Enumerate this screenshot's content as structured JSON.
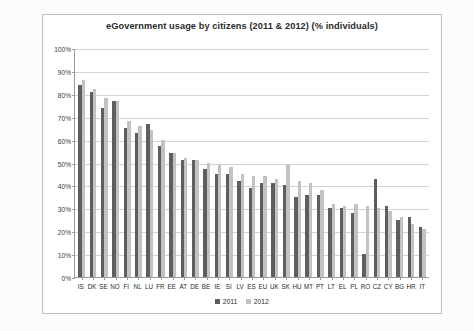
{
  "chart_data": {
    "type": "bar",
    "title": "eGovernment usage by citizens (2011 & 2012) (% individuals)",
    "xlabel": "",
    "ylabel": "",
    "ylim": [
      0,
      100
    ],
    "ytick_labels": [
      "100%",
      "90%",
      "80%",
      "70%",
      "60%",
      "50%",
      "40%",
      "30%",
      "20%",
      "10%",
      "0%"
    ],
    "ytick_values": [
      100,
      90,
      80,
      70,
      60,
      50,
      40,
      30,
      20,
      10,
      0
    ],
    "grid": true,
    "legend_position": "bottom",
    "categories": [
      "IS",
      "DK",
      "SE",
      "NO",
      "FI",
      "NL",
      "LU",
      "FR",
      "EE",
      "AT",
      "DE",
      "BE",
      "IE",
      "SI",
      "LV",
      "ES",
      "EU",
      "UK",
      "SK",
      "HU",
      "MT",
      "PT",
      "LT",
      "EL",
      "PL",
      "RO",
      "CZ",
      "CY",
      "BG",
      "HR",
      "IT"
    ],
    "series": [
      {
        "name": "2011",
        "color": "#5e5e5e",
        "values": [
          84,
          81,
          74,
          77,
          65,
          63,
          67,
          57,
          54,
          51,
          51,
          47,
          45,
          45,
          42,
          39,
          41,
          41,
          40,
          35,
          36,
          36,
          30,
          30,
          28,
          10,
          43,
          31,
          25,
          26,
          22
        ]
      },
      {
        "name": "2012",
        "color": "#c2c2c2",
        "values": [
          86,
          82,
          78,
          77,
          68,
          66,
          64,
          60,
          54,
          52,
          51,
          50,
          49,
          48,
          45,
          44,
          44,
          43,
          49,
          42,
          41,
          38,
          32,
          31,
          32,
          31,
          30,
          29,
          26,
          23,
          21
        ]
      }
    ],
    "legend": [
      "2011",
      "2012"
    ]
  }
}
